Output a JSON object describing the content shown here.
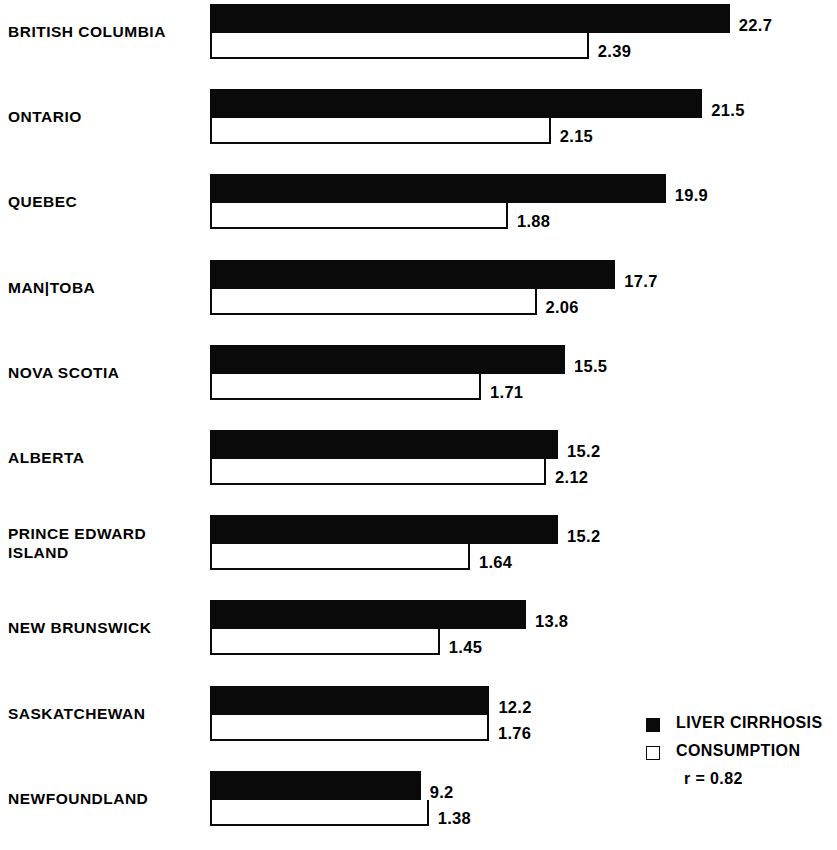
{
  "chart_data": {
    "type": "bar",
    "orientation": "horizontal",
    "title": "",
    "subtitle": "",
    "xlabel": "",
    "ylabel": "",
    "grid": false,
    "legend_position": "bottom-right",
    "categories": [
      "BRITISH COLUMBIA",
      "ONTARIO",
      "QUEBEC",
      "MAN|TOBA",
      "NOVA SCOTIA",
      "ALBERTA",
      "PRINCE EDWARD\nISLAND",
      "NEW BRUNSWICK",
      "SASKATCHEWAN",
      "NEWFOUNDLAND"
    ],
    "series": [
      {
        "name": "LIVER CIRRHOSIS",
        "style": "filled",
        "color": "#0a0a0a",
        "axis_px_per_unit": 22.9,
        "values": [
          22.7,
          21.5,
          19.9,
          17.7,
          15.5,
          15.2,
          15.2,
          13.8,
          12.2,
          9.2
        ],
        "labels": [
          "22.7",
          "21.5",
          "19.9",
          "17.7",
          "15.5",
          "15.2",
          "15.2",
          "13.8",
          "12.2",
          "9.2"
        ]
      },
      {
        "name": "CONSUMPTION",
        "style": "outline",
        "color": "#ffffff",
        "axis_px_per_unit": 158.5,
        "values": [
          2.39,
          2.15,
          1.88,
          2.06,
          1.71,
          2.12,
          1.64,
          1.45,
          1.76,
          1.38
        ],
        "labels": [
          "2.39",
          "2.15",
          "1.88",
          "2.06",
          "1.71",
          "2.12",
          "1.64",
          "1.45",
          "1.76",
          "1.38"
        ]
      }
    ],
    "annotations": [
      "r = 0.82"
    ]
  },
  "legend": {
    "items": [
      {
        "label": "LIVER CIRRHOSIS",
        "style": "filled"
      },
      {
        "label": "CONSUMPTION",
        "style": "outline"
      }
    ],
    "note": "r = 0.82"
  }
}
